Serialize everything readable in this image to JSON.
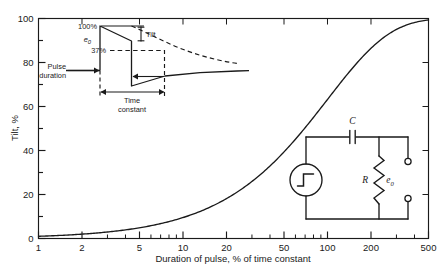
{
  "figure": {
    "background": "#ffffff",
    "ink": "#1a1a1a"
  },
  "chart_data": {
    "type": "line",
    "title": "",
    "xlabel": "Duration of pulse, % of time constant",
    "ylabel": "Tilt, %",
    "xscale": "log",
    "xlim": [
      1,
      500
    ],
    "ylim": [
      0,
      100
    ],
    "grid": false,
    "legend": null,
    "xticks": [
      1,
      2,
      5,
      10,
      20,
      50,
      100,
      200,
      500
    ],
    "xticklabels": [
      "1",
      "2",
      "5",
      "10",
      "20",
      "50",
      "100",
      "200",
      "500"
    ],
    "yticks": [
      0,
      20,
      40,
      60,
      80,
      100
    ],
    "yticklabels": [
      "0",
      "20",
      "40",
      "60",
      "80",
      "100"
    ],
    "yminorstep": 10,
    "series": [
      {
        "name": "Tilt vs pulse duration",
        "formula": "tilt = 100 * (1 - exp(-t/100))",
        "x": [
          1,
          2,
          3,
          5,
          7,
          10,
          15,
          20,
          30,
          50,
          70,
          100,
          150,
          200,
          300,
          400,
          500
        ],
        "values": [
          1.0,
          2.0,
          3.0,
          4.9,
          6.8,
          9.5,
          13.9,
          18.1,
          25.9,
          39.3,
          50.3,
          63.2,
          77.7,
          86.5,
          95.0,
          98.2,
          99.3
        ]
      }
    ]
  },
  "inset_waveform": {
    "name": "pulse-tilt-waveform",
    "labels": {
      "top_level": "100%",
      "amplitude": "e",
      "amplitude_sub": "0",
      "decay_level": "37%",
      "tilt": "Tilt",
      "pulse_duration_line1": "Pulse",
      "pulse_duration_line2": "duration",
      "time_constant_line1": "Time",
      "time_constant_line2": "constant"
    }
  },
  "inset_circuit": {
    "name": "rc-highpass-circuit",
    "labels": {
      "capacitor": "C",
      "resistor": "R",
      "output": "e",
      "output_sub": "0"
    },
    "source_icon": "step-source-icon"
  }
}
